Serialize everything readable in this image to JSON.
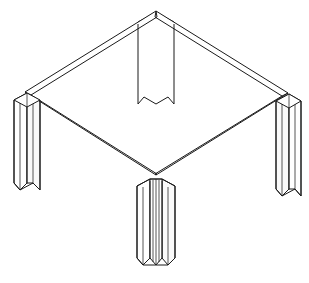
{
  "document": {
    "title": "Isometric line drawing of a four-leg table frame",
    "subject": "table-frame",
    "style": "technical line art, black outline on white",
    "width": 309,
    "height": 283,
    "background_color": "#ffffff",
    "line_color": "#1a1a1a",
    "fill_color": "#ffffff",
    "shade_color": "#fafafa"
  },
  "drawing": {
    "projection": "isometric",
    "description": "Square tabletop frame drawn as four double-line rails forming a diamond, with four L-shaped angle-profile legs at the corners.",
    "frame": {
      "name": "tabletop-rail-frame",
      "shape": "diamond",
      "rail_style": "double-line (shows rail thickness)",
      "corners": {
        "back": {
          "label": "back-corner",
          "x": 156,
          "y": 11
        },
        "left": {
          "label": "left-corner",
          "x": 25,
          "y": 92
        },
        "right": {
          "label": "right-corner",
          "x": 288,
          "y": 93
        },
        "front": {
          "label": "front-corner",
          "x": 156,
          "y": 175
        }
      },
      "rails": [
        {
          "name": "rail-back-left",
          "from": "back",
          "to": "left"
        },
        {
          "name": "rail-back-right",
          "from": "back",
          "to": "right"
        },
        {
          "name": "rail-front-left",
          "from": "left",
          "to": "front"
        },
        {
          "name": "rail-front-right",
          "from": "front",
          "to": "right"
        }
      ],
      "rail_thickness_px": 5
    },
    "legs": [
      {
        "name": "leg-back",
        "position": "back-corner",
        "profile": "L-angle",
        "top_x": 156,
        "top_y": 14,
        "bottom_y": 105,
        "half_width": 22,
        "bottom_shape": "v-notch",
        "occlusion": "passes behind the back rails, foreshortened by the tabletop plane"
      },
      {
        "name": "leg-left",
        "position": "left-corner",
        "profile": "L-angle",
        "top_x": 25,
        "top_y": 96,
        "bottom_y": 190,
        "half_width": 22,
        "bottom_shape": "flat-chamfer",
        "occlusion": "visible in full below the left corner"
      },
      {
        "name": "leg-right",
        "position": "right-corner",
        "profile": "L-angle",
        "top_x": 288,
        "top_y": 97,
        "bottom_y": 196,
        "half_width": 22,
        "bottom_shape": "flat-chamfer",
        "occlusion": "visible in full below the right corner"
      },
      {
        "name": "leg-front",
        "position": "front-corner",
        "profile": "L-angle",
        "top_x": 156,
        "top_y": 178,
        "bottom_y": 265,
        "half_width": 22,
        "bottom_shape": "v-point",
        "occlusion": "nearest to viewer, fully visible"
      }
    ],
    "annotations": []
  }
}
